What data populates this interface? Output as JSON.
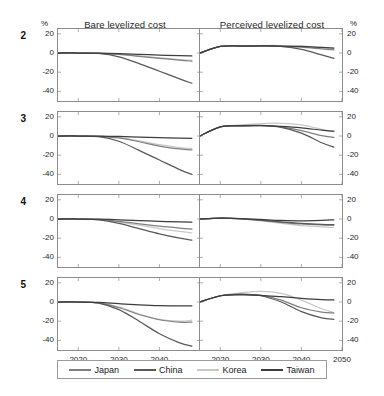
{
  "figure": {
    "unit_label_left": "%",
    "unit_label_right": "%",
    "column_titles": [
      "Bare levelized cost",
      "Perceived levelized cost"
    ],
    "row_labels": [
      "2",
      "3",
      "4",
      "5"
    ]
  },
  "legend": {
    "items": [
      {
        "label": "Japan",
        "color": "#7f7f7f"
      },
      {
        "label": "China",
        "color": "#595959"
      },
      {
        "label": "Korea",
        "color": "#c8c8c8"
      },
      {
        "label": "Taiwan",
        "color": "#3d3d3d"
      }
    ]
  },
  "chart_data": {
    "type": "line",
    "xlabel": "",
    "ylabel": "%",
    "grid": false,
    "legend_position": "bottom",
    "xlim": [
      2015,
      2050
    ],
    "ylim": [
      -50,
      25
    ],
    "yticks": [
      20,
      0,
      -20,
      -40
    ],
    "ytick_labels": [
      "20",
      "0",
      "-20",
      "-40"
    ],
    "xticks_left": [
      2020,
      2030,
      2040
    ],
    "xticks_right": [
      2020,
      2030,
      2040,
      2050
    ],
    "x": [
      2015,
      2020,
      2025,
      2030,
      2035,
      2040,
      2045,
      2048
    ],
    "panels": [
      {
        "row": "2",
        "column": "Bare levelized cost",
        "series": [
          {
            "name": "Japan",
            "values": [
              0,
              0,
              -0.3,
              -1.5,
              -3.5,
              -5.5,
              -7.5,
              -8.5
            ]
          },
          {
            "name": "China",
            "values": [
              0,
              0,
              -0.5,
              -4.0,
              -11.0,
              -19.0,
              -27.0,
              -31.5
            ]
          },
          {
            "name": "Korea",
            "values": [
              0,
              0,
              -0.2,
              -1.2,
              -3.0,
              -5.0,
              -6.8,
              -7.8
            ]
          },
          {
            "name": "Taiwan",
            "values": [
              0,
              0,
              -0.1,
              -0.6,
              -1.4,
              -2.2,
              -2.8,
              -3.0
            ]
          }
        ]
      },
      {
        "row": "2",
        "column": "Perceived levelized cost",
        "series": [
          {
            "name": "Japan",
            "values": [
              0,
              6.8,
              7.2,
              7.3,
              7.0,
              6.0,
              4.2,
              3.2
            ]
          },
          {
            "name": "China",
            "values": [
              0,
              6.8,
              7.4,
              7.5,
              6.8,
              3.8,
              -2.0,
              -5.5
            ]
          },
          {
            "name": "Korea",
            "values": [
              0,
              6.8,
              7.5,
              7.8,
              7.8,
              7.2,
              5.8,
              5.0
            ]
          },
          {
            "name": "Taiwan",
            "values": [
              0,
              6.8,
              7.2,
              7.3,
              7.2,
              6.8,
              5.8,
              5.2
            ]
          }
        ]
      },
      {
        "row": "3",
        "column": "Bare levelized cost",
        "series": [
          {
            "name": "Japan",
            "values": [
              0,
              0,
              -0.3,
              -2.0,
              -6.0,
              -10.5,
              -13.5,
              -14.5
            ]
          },
          {
            "name": "China",
            "values": [
              0,
              0,
              -0.6,
              -5.5,
              -15.0,
              -25.0,
              -35.0,
              -40.0
            ]
          },
          {
            "name": "Korea",
            "values": [
              0,
              0,
              -0.2,
              -1.6,
              -5.0,
              -9.0,
              -12.0,
              -13.0
            ]
          },
          {
            "name": "Taiwan",
            "values": [
              0,
              0,
              -0.1,
              -0.5,
              -1.2,
              -1.8,
              -2.2,
              -2.4
            ]
          }
        ]
      },
      {
        "row": "3",
        "column": "Perceived levelized cost",
        "series": [
          {
            "name": "Japan",
            "values": [
              0,
              9.5,
              10.5,
              10.8,
              9.5,
              5.5,
              0.5,
              -1.5
            ]
          },
          {
            "name": "China",
            "values": [
              0,
              9.5,
              10.8,
              11.0,
              9.0,
              3.0,
              -7.0,
              -11.5
            ]
          },
          {
            "name": "Korea",
            "values": [
              0,
              9.5,
              11.5,
              13.0,
              13.2,
              11.5,
              7.0,
              4.5
            ]
          },
          {
            "name": "Taiwan",
            "values": [
              0,
              9.5,
              10.5,
              10.8,
              10.0,
              8.5,
              6.0,
              5.0
            ]
          }
        ]
      },
      {
        "row": "4",
        "column": "Bare levelized cost",
        "series": [
          {
            "name": "Japan",
            "values": [
              0,
              0,
              -0.5,
              -2.5,
              -5.0,
              -7.5,
              -9.5,
              -10.5
            ]
          },
          {
            "name": "China",
            "values": [
              0,
              0,
              -0.8,
              -4.5,
              -10.0,
              -15.5,
              -20.0,
              -22.0
            ]
          },
          {
            "name": "Korea",
            "values": [
              0,
              0,
              -0.6,
              -3.2,
              -6.5,
              -10.0,
              -13.0,
              -14.5
            ]
          },
          {
            "name": "Taiwan",
            "values": [
              0,
              0,
              -0.2,
              -0.8,
              -1.6,
              -2.4,
              -3.0,
              -3.2
            ]
          }
        ]
      },
      {
        "row": "4",
        "column": "Perceived levelized cost",
        "series": [
          {
            "name": "Japan",
            "values": [
              0,
              0.8,
              0.2,
              -1.5,
              -3.5,
              -5.2,
              -6.2,
              -6.5
            ]
          },
          {
            "name": "China",
            "values": [
              0,
              0.8,
              0.3,
              -1.2,
              -3.0,
              -4.5,
              -5.5,
              -5.8
            ]
          },
          {
            "name": "Korea",
            "values": [
              0,
              0.8,
              0.1,
              -2.0,
              -4.5,
              -6.8,
              -8.2,
              -8.8
            ]
          },
          {
            "name": "Taiwan",
            "values": [
              0,
              0.8,
              0.5,
              -0.5,
              -1.5,
              -2.0,
              -1.5,
              -0.8
            ]
          }
        ]
      },
      {
        "row": "5",
        "column": "Bare levelized cost",
        "series": [
          {
            "name": "Japan",
            "values": [
              0,
              0,
              -1.0,
              -6.0,
              -13.0,
              -18.5,
              -21.0,
              -21.0
            ]
          },
          {
            "name": "China",
            "values": [
              0,
              0,
              -1.2,
              -8.0,
              -20.0,
              -33.0,
              -42.5,
              -46.0
            ]
          },
          {
            "name": "Korea",
            "values": [
              0,
              0,
              -0.8,
              -5.0,
              -12.5,
              -18.0,
              -20.0,
              -19.0
            ]
          },
          {
            "name": "Taiwan",
            "values": [
              0,
              0,
              -0.4,
              -1.8,
              -3.0,
              -3.8,
              -4.0,
              -4.0
            ]
          }
        ]
      },
      {
        "row": "5",
        "column": "Perceived levelized cost",
        "series": [
          {
            "name": "Japan",
            "values": [
              0,
              6.5,
              8.0,
              7.0,
              2.0,
              -6.0,
              -10.5,
              -11.5
            ]
          },
          {
            "name": "China",
            "values": [
              0,
              6.5,
              8.2,
              6.5,
              0.0,
              -10.0,
              -16.5,
              -18.0
            ]
          },
          {
            "name": "Korea",
            "values": [
              0,
              6.5,
              9.5,
              11.0,
              9.0,
              2.0,
              -7.0,
              -11.0
            ]
          },
          {
            "name": "Taiwan",
            "values": [
              0,
              6.5,
              7.5,
              7.0,
              5.5,
              3.8,
              2.5,
              2.2
            ]
          }
        ]
      }
    ]
  }
}
